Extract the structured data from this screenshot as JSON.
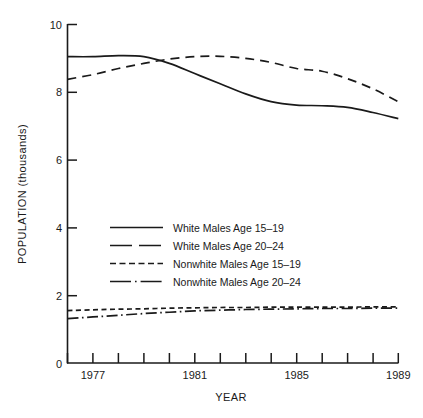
{
  "chart_data": {
    "type": "line",
    "title": "",
    "xlabel": "YEAR",
    "ylabel": "POPULATION (thousands)",
    "xlim": [
      1976,
      1989
    ],
    "ylim": [
      0,
      10
    ],
    "x": [
      1976,
      1977,
      1978,
      1979,
      1980,
      1981,
      1982,
      1983,
      1984,
      1985,
      1986,
      1987,
      1988,
      1989
    ],
    "xticks": [
      1976,
      1977,
      1978,
      1979,
      1980,
      1981,
      1982,
      1983,
      1984,
      1985,
      1986,
      1987,
      1988,
      1989
    ],
    "xtick_labels": [
      "",
      "1977",
      "",
      "",
      "",
      "1981",
      "",
      "",
      "",
      "1985",
      "",
      "",
      "",
      "1989"
    ],
    "yticks": [
      0,
      2,
      4,
      6,
      8,
      10
    ],
    "ytick_labels": [
      "0",
      "2",
      "4",
      "6",
      "8",
      "10"
    ],
    "grid": false,
    "legend_position": "center-left",
    "series": [
      {
        "name": "White Males Age 15-19",
        "style": "solid",
        "values": [
          9.05,
          9.05,
          9.08,
          9.05,
          8.85,
          8.55,
          8.25,
          7.95,
          7.72,
          7.62,
          7.6,
          7.55,
          7.4,
          7.22
        ]
      },
      {
        "name": "White Males Age 20-24",
        "style": "long-dash",
        "values": [
          8.38,
          8.52,
          8.7,
          8.85,
          8.98,
          9.05,
          9.06,
          9.0,
          8.88,
          8.7,
          8.62,
          8.4,
          8.1,
          7.72
        ]
      },
      {
        "name": "Nonwhite Males Age 15-19",
        "style": "short-dash",
        "values": [
          1.55,
          1.57,
          1.59,
          1.6,
          1.62,
          1.63,
          1.64,
          1.64,
          1.65,
          1.65,
          1.65,
          1.65,
          1.66,
          1.66
        ]
      },
      {
        "name": "Nonwhite Males Age 20-24",
        "style": "dash-dot",
        "values": [
          1.31,
          1.36,
          1.41,
          1.46,
          1.5,
          1.54,
          1.56,
          1.58,
          1.59,
          1.6,
          1.61,
          1.61,
          1.62,
          1.62
        ]
      }
    ]
  },
  "axes": {
    "y_title": "POPULATION (thousands)",
    "x_title": "YEAR",
    "y_labels": [
      "10",
      "8",
      "6",
      "4",
      "2",
      "0"
    ],
    "x_labels": [
      "1977",
      "1981",
      "1985",
      "1989"
    ]
  },
  "legend": {
    "items": [
      {
        "label": "White Males Age 15–19",
        "style": "solid"
      },
      {
        "label": "White Males Age 20–24",
        "style": "long-dash"
      },
      {
        "label": "Nonwhite Males Age 15–19",
        "style": "short-dash"
      },
      {
        "label": "Nonwhite Males Age 20–24",
        "style": "dash-dot"
      }
    ]
  },
  "colors": {
    "line": "#1a1a1a",
    "axis": "#1a1a1a",
    "background": "#ffffff"
  }
}
